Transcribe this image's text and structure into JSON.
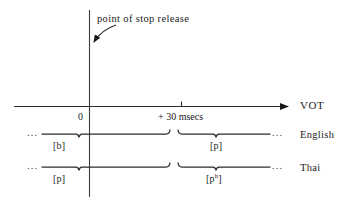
{
  "figure": {
    "annotation": "point of stop release",
    "axis": {
      "name": "VOT",
      "origin_label": "0",
      "tick_label": "+ 30 msecs"
    },
    "rows": [
      {
        "name": "English",
        "left_segment": "[b]",
        "right_segment": "[p]",
        "right_segment_sup": "",
        "left_dots": "...",
        "right_dots": "..."
      },
      {
        "name": "Thai",
        "left_segment": "[p]",
        "right_segment": "[p",
        "right_segment_sup": "h",
        "right_segment_close": "]",
        "left_dots": "...",
        "right_dots": "..."
      }
    ],
    "colors": {
      "ink": "#1a1a1a",
      "background": "#ffffff"
    }
  }
}
